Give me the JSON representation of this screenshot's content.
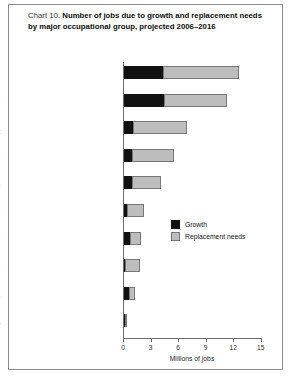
{
  "figure": {
    "label_prefix": "Chart 10.",
    "title": "Number of jobs due to growth and replacement needs by major occupational group, projected 2006–2016"
  },
  "legend": {
    "position": "middle-right",
    "items": [
      {
        "label": "Growth",
        "color": "#111111",
        "key": "growth"
      },
      {
        "label": "Replacement needs",
        "color": "#bdbdbd",
        "key": "replacement"
      }
    ]
  },
  "axis": {
    "x_title": "Millions of jobs",
    "x_ticks": [
      "0",
      "3",
      "6",
      "9",
      "12",
      "15"
    ]
  },
  "chart_data": {
    "type": "bar",
    "orientation": "horizontal",
    "stacked": true,
    "title": "Chart 10. Number of jobs due to growth and replacement needs by major occupational group, projected 2006–2016",
    "xlabel": "Millions of jobs",
    "ylabel": "",
    "xlim": [
      0,
      15
    ],
    "xticks": [
      0,
      3,
      6,
      9,
      12,
      15
    ],
    "grid": false,
    "legend_position": "middle-right",
    "categories": [
      "Service",
      "Professional and related",
      "Office and administrative support",
      "Sales and related",
      "Management, business, and financial",
      "Transportation and material moving",
      "Production",
      "Construction and extraction",
      "Installation, maintenance, and repair",
      "Farming, fishing, and forestry"
    ],
    "category_labels_display": [
      "Service",
      "Professional and related",
      "Office and administrative\nsupport",
      "Sales and related",
      "Management, business,\nand financial",
      "Transportation and\nmaterial moving",
      "Production",
      "Construction and extraction",
      "Installation, maintenance,\nand repair",
      "Farming, fishing,\nand forestry"
    ],
    "series": [
      {
        "name": "Growth",
        "color": "#111111",
        "values": [
          4.3,
          4.4,
          1.0,
          0.9,
          0.9,
          0.3,
          0.6,
          0.1,
          0.5,
          0.1
        ]
      },
      {
        "name": "Replacement needs",
        "color": "#bdbdbd",
        "values": [
          8.2,
          6.8,
          5.9,
          4.6,
          3.1,
          1.9,
          1.2,
          1.6,
          0.7,
          0.2
        ]
      }
    ],
    "totals": [
      12.5,
      11.2,
      6.9,
      5.5,
      4.0,
      2.2,
      1.8,
      1.7,
      1.2,
      0.3
    ]
  }
}
